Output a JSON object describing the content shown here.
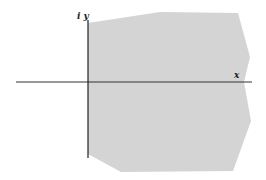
{
  "diagram": {
    "region": {
      "fill": "#d4d4d4",
      "points": "88,23 160,12 238,13 250,57 244,82 251,121 233,171 121,172 88,154"
    },
    "x_axis": {
      "label": "x",
      "x1": 16,
      "y1": 82,
      "x2": 252,
      "y2": 82,
      "color": "#333333"
    },
    "y_axis": {
      "label": "i y",
      "x1": 88,
      "y1": 20,
      "x2": 88,
      "y2": 158,
      "color": "#222222"
    }
  }
}
